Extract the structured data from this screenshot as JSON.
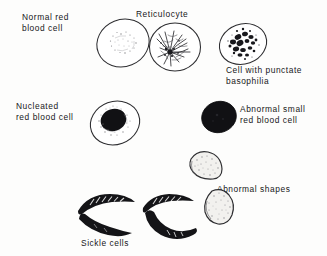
{
  "figure": {
    "background_color": "#fdfdfc",
    "ink_color": "#17171a"
  },
  "labels": {
    "normal_rbc": "Normal red\nblood cell",
    "reticulocyte": "Reticulocyte",
    "punctate_basophilia": "Cell with punctate\nbasophilia",
    "nucleated_rbc": "Nucleated\nred blood cell",
    "abnormal_small_rbc": "Abnormal small\nred blood cell",
    "abnormal_shapes": "Abnormal shapes",
    "sickle_cells": "Sickle cells"
  },
  "cells": [
    {
      "name": "normal-red-blood-cell",
      "label_key": "normal_rbc",
      "appearance": "pale outlined oval with faint central stippling",
      "fill": "#ffffff",
      "outline": "#2a2a2d"
    },
    {
      "name": "reticulocyte",
      "label_key": "reticulocyte",
      "appearance": "outlined oval with dark radiating reticular filament network",
      "fill": "#ffffff",
      "outline": "#2a2a2d"
    },
    {
      "name": "cell-with-punctate-basophilia",
      "label_key": "punctate_basophilia",
      "appearance": "oval with dense coarse dark basophilic granules",
      "fill": "#ffffff",
      "outline": "#2a2a2d"
    },
    {
      "name": "nucleated-red-blood-cell",
      "label_key": "nucleated_rbc",
      "appearance": "outlined oval containing solid dark round nucleus",
      "fill": "#ffffff",
      "outline": "#2a2a2d",
      "nucleus_fill": "#111114"
    },
    {
      "name": "abnormal-small-red-blood-cell",
      "label_key": "abnormal_small_rbc",
      "appearance": "small solid black filled round cell",
      "fill": "#111114",
      "outline": "#111114"
    },
    {
      "name": "abnormal-shape-upper",
      "label_key": "abnormal_shapes",
      "appearance": "stippled half-moon / dome shaped cell",
      "fill": "#f2f1ee",
      "outline": "#2a2a2d"
    },
    {
      "name": "abnormal-shape-lower",
      "label_key": "abnormal_shapes",
      "appearance": "stippled teardrop / pear shaped cell",
      "fill": "#f2f1ee",
      "outline": "#2a2a2d"
    },
    {
      "name": "sickle-cell-upper-left",
      "label_key": "sickle_cells",
      "appearance": "dark crescent with internal white striations",
      "fill": "#141417"
    },
    {
      "name": "sickle-cell-lower-left",
      "label_key": "sickle_cells",
      "appearance": "dark slender curved crescent",
      "fill": "#141417"
    },
    {
      "name": "sickle-cell-upper-right",
      "label_key": "sickle_cells",
      "appearance": "dark crescent with internal white striations",
      "fill": "#141417"
    },
    {
      "name": "sickle-cell-lower-right",
      "label_key": "sickle_cells",
      "appearance": "dark thick curved crescent",
      "fill": "#141417"
    }
  ]
}
